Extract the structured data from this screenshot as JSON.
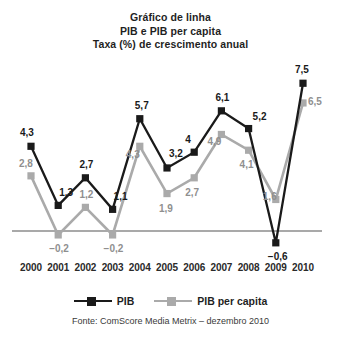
{
  "chart_data": {
    "type": "line",
    "title": "Gráfico de linha\nPIB e PIB per capita\nTaxa (%) de crescimento anual",
    "title_lines": [
      "Gráfico de linha",
      "PIB e PIB per capita",
      "Taxa (%) de crescimento anual"
    ],
    "xlabel": "",
    "ylabel": "Taxa (%) de crescimento anual",
    "categories": [
      "2000",
      "2001",
      "2002",
      "2003",
      "2004",
      "2005",
      "2006",
      "2007",
      "2008",
      "2009",
      "2010"
    ],
    "x": [
      2000,
      2001,
      2002,
      2003,
      2004,
      2005,
      2006,
      2007,
      2008,
      2009,
      2010
    ],
    "series": [
      {
        "name": "PIB",
        "color": "#1a1a1a",
        "marker": "square",
        "values": [
          4.3,
          1.3,
          2.7,
          1.1,
          5.7,
          3.2,
          4.0,
          6.1,
          5.2,
          -0.6,
          7.5
        ],
        "data_labels": [
          "4,3",
          "1,3",
          "2,7",
          "1,1",
          "5,7",
          "3,2",
          "4",
          "6,1",
          "5,2",
          "−0,6",
          "7,5"
        ]
      },
      {
        "name": "PIB per capita",
        "color": "#aaaaaa",
        "marker": "square",
        "values": [
          2.8,
          -0.2,
          1.2,
          -0.2,
          4.3,
          1.9,
          2.7,
          4.9,
          4.1,
          1.6,
          6.5
        ],
        "data_labels": [
          "2,8",
          "−0,2",
          "1,2",
          "−0,2",
          "4,3",
          "1,9",
          "2,7",
          "4,9",
          "4,1",
          "1,6",
          "6,5"
        ]
      }
    ],
    "ylim": [
      -1.2,
      8.2
    ],
    "grid": false,
    "zero_line": true,
    "legend": [
      "PIB",
      "PIB per capita"
    ],
    "legend_position": "bottom",
    "annotations": [
      "Fonte: ComScore Media Metrix – dezembro 2010"
    ]
  },
  "legend": {
    "items": [
      {
        "label": "PIB",
        "color": "#1a1a1a"
      },
      {
        "label": "PIB per capita",
        "color": "#aaaaaa"
      }
    ]
  },
  "source": {
    "text": "Fonte: ComScore Media Metrix – dezembro 2010"
  },
  "colors": {
    "pib": "#1a1a1a",
    "pib_per_capita": "#aaaaaa",
    "axis": "#555555",
    "background": "#ffffff"
  }
}
